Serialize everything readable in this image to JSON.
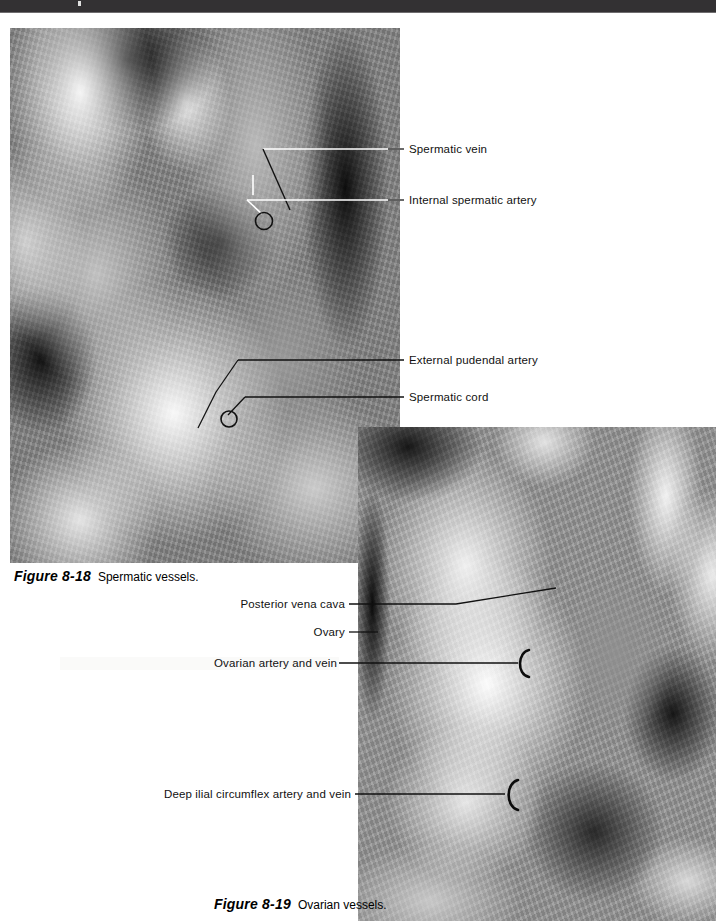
{
  "page": {
    "header_band_color": "#333133",
    "background_color": "#ffffff",
    "width": 716,
    "height": 921
  },
  "figures": [
    {
      "id": "8-18",
      "number": "Figure 8-18",
      "title": "Spermatic vessels.",
      "plate": {
        "name": "spermatic-vessels-photograph",
        "type": "grayscale anatomical dissection photograph"
      },
      "labels": [
        {
          "text": "Spermatic vein",
          "side": "right"
        },
        {
          "text": "Internal spermatic artery",
          "side": "right"
        },
        {
          "text": "External pudendal artery",
          "side": "right"
        },
        {
          "text": "Spermatic cord",
          "side": "right"
        }
      ]
    },
    {
      "id": "8-19",
      "number": "Figure 8-19",
      "title": "Ovarian vessels.",
      "plate": {
        "name": "ovarian-vessels-photograph",
        "type": "grayscale anatomical dissection photograph"
      },
      "labels": [
        {
          "text": "Posterior vena cava",
          "side": "left"
        },
        {
          "text": "Ovary",
          "side": "left"
        },
        {
          "text": "Ovarian artery and vein",
          "side": "left"
        },
        {
          "text": "Deep ilial circumflex artery and vein",
          "side": "left"
        }
      ]
    }
  ]
}
